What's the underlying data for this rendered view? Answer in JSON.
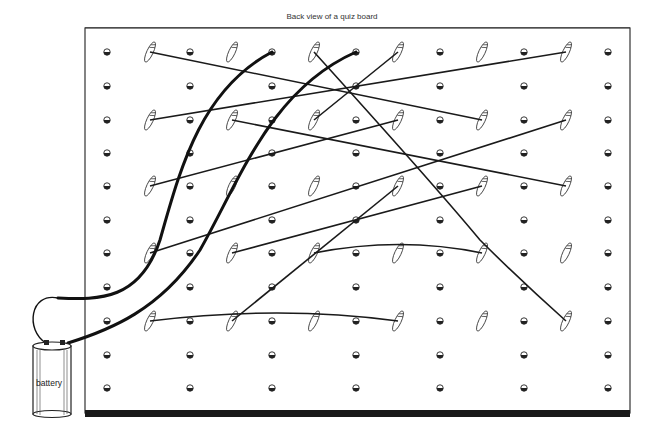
{
  "title": "Back  view of a quiz board",
  "battery": {
    "label": "battery"
  },
  "board": {
    "left": 85,
    "top": 28,
    "right": 630,
    "bottom": 413,
    "screw_columns": [
      107,
      190,
      272,
      356,
      440,
      524,
      608
    ],
    "clip_columns": [
      150,
      232,
      314,
      398,
      482,
      566
    ],
    "rows": [
      52,
      86,
      120,
      153,
      186,
      220,
      253,
      287,
      321,
      355,
      388
    ],
    "clip_rows": [
      52,
      120,
      186,
      253,
      321
    ]
  },
  "wires": [
    {
      "from": [
        150,
        52
      ],
      "to": [
        482,
        120
      ],
      "type": "thin"
    },
    {
      "from": [
        150,
        120
      ],
      "to": [
        566,
        52
      ],
      "type": "thin"
    },
    {
      "from": [
        232,
        120
      ],
      "to": [
        566,
        186
      ],
      "type": "thin"
    },
    {
      "from": [
        314,
        52
      ],
      "to": [
        566,
        321
      ],
      "type": "thin-curve"
    },
    {
      "from": [
        314,
        120
      ],
      "to": [
        398,
        52
      ],
      "type": "thin"
    },
    {
      "from": [
        150,
        186
      ],
      "to": [
        398,
        120
      ],
      "type": "thin"
    },
    {
      "from": [
        150,
        253
      ],
      "to": [
        566,
        120
      ],
      "type": "thin"
    },
    {
      "from": [
        232,
        253
      ],
      "to": [
        482,
        186
      ],
      "type": "thin"
    },
    {
      "from": [
        314,
        253
      ],
      "to": [
        482,
        253
      ],
      "type": "thin-curve"
    },
    {
      "from": [
        398,
        186
      ],
      "to": [
        232,
        321
      ],
      "type": "thin"
    },
    {
      "from": [
        150,
        321
      ],
      "to": [
        398,
        321
      ],
      "type": "thin-curve"
    }
  ],
  "battery_leads": [
    {
      "from": [
        272,
        52
      ],
      "to": [
        58,
        298
      ],
      "type": "thick"
    },
    {
      "from": [
        356,
        52
      ],
      "to": [
        68,
        343
      ],
      "type": "thick"
    }
  ]
}
